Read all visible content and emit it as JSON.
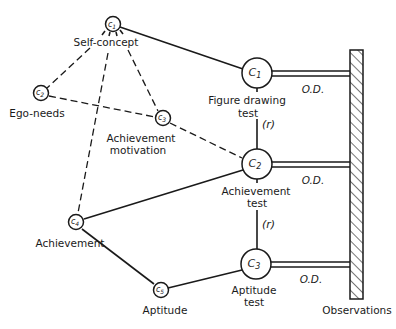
{
  "diagram": {
    "title": "",
    "latent_constructs": [
      {
        "id": "c1",
        "symbol": "c",
        "subscript": "1",
        "label": "Self-concept"
      },
      {
        "id": "c2",
        "symbol": "c",
        "subscript": "2",
        "label": "Ego-needs"
      },
      {
        "id": "c3",
        "symbol": "c",
        "subscript": "3",
        "label_line1": "Achievement",
        "label_line2": "motivation"
      },
      {
        "id": "c4",
        "symbol": "c",
        "subscript": "4",
        "label": "Achievement"
      },
      {
        "id": "c5",
        "symbol": "c",
        "subscript": "5",
        "label": "Aptitude"
      }
    ],
    "measured_constructs": [
      {
        "id": "C1",
        "symbol": "C",
        "subscript": "1",
        "label_line1": "Figure drawing",
        "label_line2": "test"
      },
      {
        "id": "C2",
        "symbol": "C",
        "subscript": "2",
        "label_line1": "Achievement",
        "label_line2": "test"
      },
      {
        "id": "C3",
        "symbol": "C",
        "subscript": "3",
        "label_line1": "Aptitude",
        "label_line2": "test"
      }
    ],
    "operational_definitions": [
      {
        "from": "C1",
        "label": "O.D."
      },
      {
        "from": "C2",
        "label": "O.D."
      },
      {
        "from": "C3",
        "label": "O.D."
      }
    ],
    "reliability_links": [
      {
        "from": "C1",
        "to": "C2",
        "label": "(r)"
      },
      {
        "from": "C2",
        "to": "C3",
        "label": "(r)"
      }
    ],
    "observations_label": "Observations",
    "edges": [
      {
        "from": "c1",
        "to": "C1",
        "style": "solid"
      },
      {
        "from": "c4",
        "to": "C2",
        "style": "solid"
      },
      {
        "from": "c4",
        "to": "c5",
        "style": "solid"
      },
      {
        "from": "c5",
        "to": "C3",
        "style": "solid"
      },
      {
        "from": "c1",
        "to": "c2",
        "style": "dashed"
      },
      {
        "from": "c1",
        "to": "c3",
        "style": "dashed"
      },
      {
        "from": "c1",
        "to": "c4",
        "style": "dashed"
      },
      {
        "from": "c2",
        "to": "c3",
        "style": "dashed"
      },
      {
        "from": "c3",
        "to": "C2",
        "style": "dashed"
      }
    ]
  }
}
